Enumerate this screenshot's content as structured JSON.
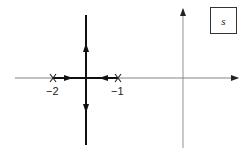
{
  "diagram": {
    "type": "root-locus",
    "plane_label": "s",
    "poles": [
      {
        "label": "−2",
        "value": -2
      },
      {
        "label": "−1",
        "value": -1
      }
    ],
    "breakaway_point": -1.5,
    "colors": {
      "axis": "#555555",
      "locus": "#111111"
    }
  }
}
